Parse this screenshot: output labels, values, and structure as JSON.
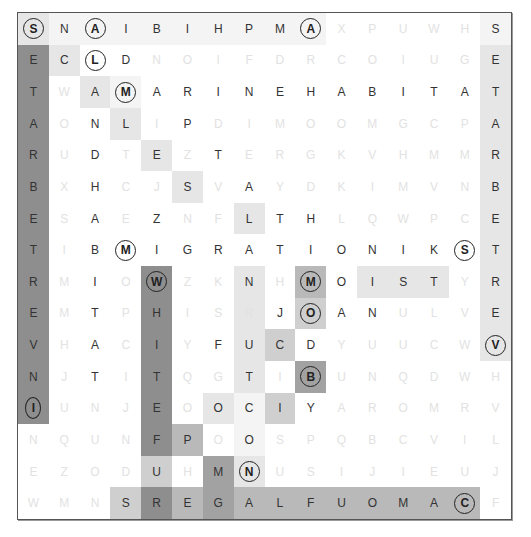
{
  "puzzle": {
    "rows": 16,
    "cols": 16,
    "colors": {
      "dark": "#8e8e8e",
      "medium": "#b9b9b9",
      "light": "#e6e6e6",
      "faint_letter": "#e2e2e2",
      "letter": "#333333",
      "border": "#555555"
    },
    "grid": [
      "SNAIBIHPMAXPUWHS",
      "ECLDNOIFDRCOIUGE",
      "TWAMARINEHABITAT",
      "AONLIPDIMOOMGCPA",
      "RUDTEZTERGKVHMMR",
      "BXHCJSVAYDKIMVNB",
      "ESAEZNFLTHLQWPCE",
      "TIBMIGRATIONIKST",
      "RMIOWZKNHMOISTYR",
      "EMTPHISRJOANULVE",
      "VHACIYFUCDYUUCWV",
      "NJTITQGTIBUNQDWH",
      "IUNJEOOCIYAROMRV",
      "NQUNFPOOSPQBCVIL",
      "EZODUHMNUSIJIEUJ",
      "WMNSREGALFUOMACF"
    ],
    "faint": [
      "0000000000111110",
      "0000111111111110",
      "0100000000000000",
      "0100101111111110",
      "0101010111111110",
      "0101101011111110",
      "0101011000111110",
      "0100000000000000",
      "0101011010000010",
      "0101011101001110",
      "0101010000111110",
      "0101011010111111",
      "0111010000111111",
      "1111001011111111",
      "1111010011111111",
      "1110000000000001"
    ],
    "shade": [
      "2111111111000001",
      "6200000000000002",
      "6021000000000002",
      "6002000000000002",
      "6000200000000002",
      "6000020000000002",
      "6000000200000002",
      "6000000000000002",
      "6000600204022202",
      "6000600203000002",
      "6000600230000002",
      "6000600205000000",
      "6000602130000000",
      "0000640100000000",
      "0000305200000000",
      "0003645444444440"
    ],
    "circled": [
      [
        0,
        0,
        "S"
      ],
      [
        0,
        2,
        "A"
      ],
      [
        0,
        9,
        "A"
      ],
      [
        1,
        2,
        "L"
      ],
      [
        2,
        3,
        "M"
      ],
      [
        7,
        3,
        "M"
      ],
      [
        7,
        14,
        "S"
      ],
      [
        8,
        4,
        "W"
      ],
      [
        8,
        9,
        "M"
      ],
      [
        9,
        9,
        "O"
      ],
      [
        10,
        15,
        "V"
      ],
      [
        11,
        9,
        "B"
      ],
      [
        12,
        0,
        "I"
      ],
      [
        14,
        7,
        "N"
      ],
      [
        15,
        14,
        "C"
      ]
    ],
    "found_words": [
      "SEATARBETTREVNI",
      "SETARBETREV",
      "MARINEHABITAT",
      "MIGRATION",
      "MOIST",
      "WHITEFUR",
      "REGALFUOMAC",
      "SNAIBIHPMA",
      "CLAMLESAL",
      "ANTARCTIC",
      "MOB",
      "COOL"
    ]
  }
}
